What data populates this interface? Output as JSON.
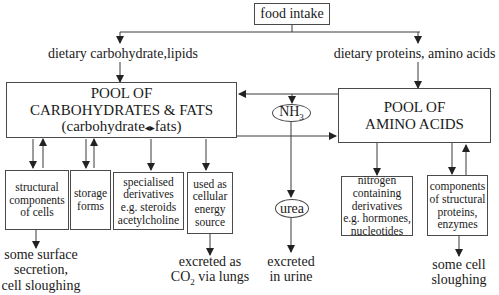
{
  "diagram": {
    "top_node": "food intake",
    "left_input": "dietary carbohydrate,lipids",
    "right_input": "dietary proteins, amino acids",
    "carb_pool": {
      "line1": "POOL OF",
      "line2": "CARBOHYDRATES & FATS",
      "line3_left": "(carbohydrate",
      "line3_arrow": "◂▸",
      "line3_right": "fats)"
    },
    "amino_pool": {
      "line1": "POOL OF",
      "line2": "AMINO ACIDS"
    },
    "nh3": {
      "base": "NH",
      "sub": "3"
    },
    "urea": "urea",
    "carb_outputs": [
      {
        "lines": [
          "structural",
          "components",
          "of cells"
        ]
      },
      {
        "lines": [
          "storage",
          "forms"
        ]
      },
      {
        "lines": [
          "specialised",
          "derivatives",
          "e.g. steroids",
          "acetylcholine"
        ]
      },
      {
        "lines": [
          "used as",
          "cellular",
          "energy",
          "source"
        ]
      }
    ],
    "amino_outputs": [
      {
        "lines": [
          "nitrogen",
          "containing",
          "derivatives",
          "e.g. hormones,",
          "nucleotides"
        ]
      },
      {
        "lines": [
          "components",
          "of structural",
          "proteins,",
          "enzymes"
        ]
      }
    ],
    "end_labels": {
      "surface": [
        "some surface",
        "secretion,",
        "cell sloughing"
      ],
      "co2_line1": "excreted as",
      "co2_base": "CO",
      "co2_sub": "2",
      "co2_rest": " via lungs",
      "urine": [
        "excreted",
        "in urine"
      ],
      "sloughing": [
        "some cell",
        "sloughing"
      ]
    },
    "colors": {
      "line": "#3a3a3a",
      "text": "#1a1a1a",
      "background": "#ffffff"
    }
  }
}
